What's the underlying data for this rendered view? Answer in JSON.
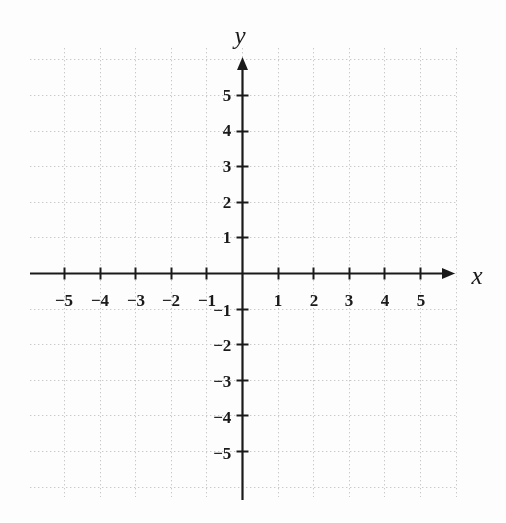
{
  "figure": {
    "kind": "cartesian-coordinate-plane",
    "width": 506,
    "height": 523,
    "background_color": "#fdfdfd",
    "axis_color": "#1a1a1a",
    "grid_color": "#c9c9c9"
  },
  "axes": {
    "x": {
      "name": "x",
      "name_position": {
        "x": 477,
        "y": 275
      },
      "arrow": true,
      "line_start_x": 30,
      "line_end_x": 455,
      "y": 273
    },
    "y": {
      "name": "y",
      "name_position": {
        "x": 240,
        "y": 35
      },
      "arrow": true,
      "line_start_y": 57,
      "line_end_y": 500,
      "x": 242
    }
  },
  "chart_data": {
    "type": "scatter",
    "title": "",
    "subtitle": "",
    "xlabel": "x",
    "ylabel": "y",
    "xlim": [
      -6,
      6
    ],
    "ylim": [
      -6,
      6
    ],
    "grid": true,
    "grid_style": "dotted",
    "grid_spacing": 1,
    "legend": null,
    "annotations": [],
    "series": [],
    "x_ticks": [
      -5,
      -4,
      -3,
      -2,
      -1,
      1,
      2,
      3,
      4,
      5
    ],
    "y_ticks": [
      5,
      4,
      3,
      2,
      1,
      -1,
      -2,
      -3,
      -4,
      -5
    ],
    "x_tick_labels": [
      "−5",
      "−4",
      "−3",
      "−2",
      "−1",
      "1",
      "2",
      "3",
      "4",
      "5"
    ],
    "y_tick_labels": [
      "5",
      "4",
      "3",
      "2",
      "1",
      "−1",
      "−2",
      "−3",
      "−4",
      "−5"
    ]
  },
  "x_tick_items": [
    {
      "label": "−5",
      "value": -5,
      "px": 64,
      "py": 292
    },
    {
      "label": "−4",
      "value": -4,
      "px": 100,
      "py": 292
    },
    {
      "label": "−3",
      "value": -3,
      "px": 136,
      "py": 292
    },
    {
      "label": "−2",
      "value": -2,
      "px": 171,
      "py": 292
    },
    {
      "label": "−1",
      "value": -1,
      "px": 207,
      "py": 292
    },
    {
      "label": "1",
      "value": 1,
      "px": 278,
      "py": 292
    },
    {
      "label": "2",
      "value": 2,
      "px": 314,
      "py": 292
    },
    {
      "label": "3",
      "value": 3,
      "px": 349,
      "py": 292
    },
    {
      "label": "4",
      "value": 4,
      "px": 385,
      "py": 292
    },
    {
      "label": "5",
      "value": 5,
      "px": 421,
      "py": 292
    }
  ],
  "y_tick_items": [
    {
      "label": "5",
      "value": 5,
      "px": 231,
      "py": 95
    },
    {
      "label": "4",
      "value": 4,
      "px": 231,
      "py": 130
    },
    {
      "label": "3",
      "value": 3,
      "px": 231,
      "py": 166
    },
    {
      "label": "2",
      "value": 2,
      "px": 231,
      "py": 202
    },
    {
      "label": "1",
      "value": 1,
      "px": 231,
      "py": 237
    },
    {
      "label": "−1",
      "value": -1,
      "px": 231,
      "py": 310
    },
    {
      "label": "−2",
      "value": -2,
      "px": 231,
      "py": 345
    },
    {
      "label": "−3",
      "value": -3,
      "px": 231,
      "py": 381
    },
    {
      "label": "−4",
      "value": -4,
      "px": 231,
      "py": 417
    },
    {
      "label": "−5",
      "value": -5,
      "px": 231,
      "py": 453
    }
  ]
}
